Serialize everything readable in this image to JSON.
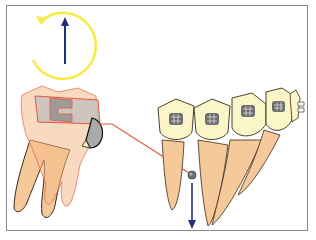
{
  "diagram": {
    "title": "",
    "colors": {
      "frame": "#8a8a8a",
      "rotation_arrow": "#f5ec4a",
      "force_arrow": "#1f2f7a",
      "root": "#f5c99a",
      "root_outline": "#3a2a1a",
      "crown": "#fbf6c8",
      "bracket": "#6d6d6d",
      "transparent_tooth": "#f4b98a",
      "band_outline": "#e0583a",
      "wire": "#e0583a",
      "miniscrew": "#6f7478"
    },
    "elements": [
      {
        "id": "rotation-arrow",
        "label": "rotation arrow (counter-clockwise)"
      },
      {
        "id": "upward-force-arrow",
        "label": "upward force arrow"
      },
      {
        "id": "molar",
        "label": "molar tooth with band"
      },
      {
        "id": "lever-wire",
        "label": "lever wire"
      },
      {
        "id": "miniscrew",
        "label": "miniscrew"
      },
      {
        "id": "downward-force-arrow",
        "label": "downward force arrow"
      },
      {
        "id": "anterior-teeth",
        "label": "anterior teeth with brackets",
        "count": 5
      }
    ]
  }
}
